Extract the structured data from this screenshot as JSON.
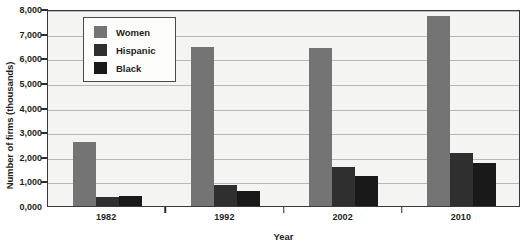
{
  "chart_data": {
    "type": "bar",
    "title": "",
    "xlabel": "Year",
    "ylabel": "Number of firms (thousands)",
    "categories": [
      "1982",
      "1992",
      "2002",
      "2010"
    ],
    "series": [
      {
        "name": "Women",
        "color": "#747474",
        "values": [
          2600,
          6450,
          6400,
          7700
        ]
      },
      {
        "name": "Hispanic",
        "color": "#2f2f2f",
        "values": [
          350,
          860,
          1570,
          2150
        ]
      },
      {
        "name": "Black",
        "color": "#191919",
        "values": [
          400,
          620,
          1200,
          1750
        ]
      }
    ],
    "ylim": [
      0,
      8000
    ],
    "ytick_values": [
      0,
      1000,
      2000,
      3000,
      4000,
      5000,
      6000,
      7000,
      8000
    ],
    "ytick_labels": [
      "0,000",
      "1,000",
      "2,000",
      "3,000",
      "4,000",
      "5,000",
      "6,000",
      "7,000",
      "8,000"
    ],
    "grid": true,
    "legend_position": "upper-left-inside"
  }
}
